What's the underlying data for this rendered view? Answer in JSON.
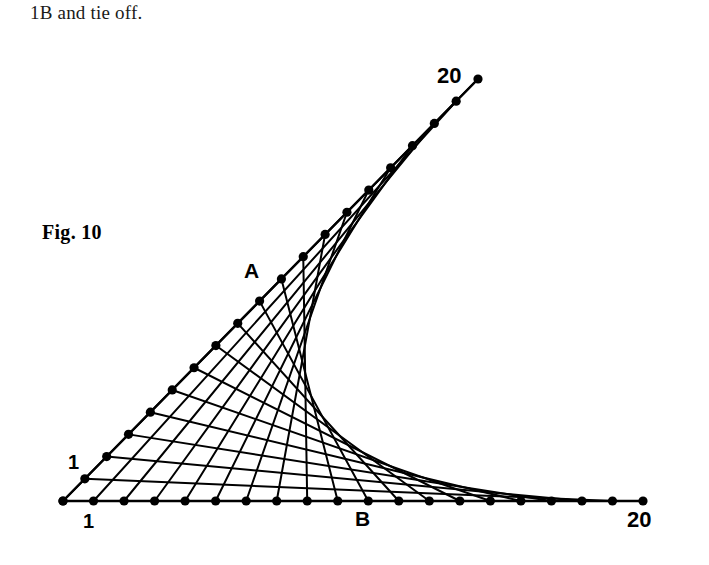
{
  "page": {
    "background_color": "#ffffff",
    "ink_color": "#000000",
    "width": 709,
    "height": 565
  },
  "body_text": {
    "line": "1B and tie off."
  },
  "figure": {
    "caption": "Fig. 10",
    "labels": {
      "ray_a": "A",
      "ray_b": "B",
      "a_start": "1",
      "b_start": "1",
      "a_end": "20",
      "b_end": "20"
    },
    "label_positions": {
      "caption": {
        "x": 42,
        "y": 222
      },
      "ray_a": {
        "x": 244,
        "y": 260
      },
      "ray_b": {
        "x": 355,
        "y": 508
      },
      "a_start": {
        "x": 68,
        "y": 452
      },
      "b_start": {
        "x": 83,
        "y": 511
      },
      "a_end": {
        "x": 437,
        "y": 65
      },
      "b_end": {
        "x": 627,
        "y": 509
      }
    }
  },
  "chart_data": {
    "type": "line",
    "title": "Fig. 10",
    "subtitle": "Curve stitching: parabolic envelope from two straight rays",
    "xlabel": "",
    "ylabel": "",
    "grid": false,
    "legend": false,
    "construction": {
      "description": "Two straight rays share a common vertex. Each ray carries 20 evenly spaced marked points numbered 1 to 20 outward from the vertex. Point i on ray A is joined by a straight thread to point (21 - i) on ray B. The 20 threads are tangent to a parabola, whose envelope forms the curve.",
      "points_per_ray": 20,
      "pairing_rule": "A[i] connects to B[21-i]",
      "vertex": {
        "x": 63,
        "y": 501
      },
      "ray_a": {
        "label": "A",
        "start_label": "1",
        "end_label": "20",
        "start": {
          "x": 63,
          "y": 501
        },
        "end": {
          "x": 478,
          "y": 79
        },
        "point_spacing_px": 29.6
      },
      "ray_b": {
        "label": "B",
        "start_label": "1",
        "end_label": "20",
        "start": {
          "x": 63,
          "y": 501
        },
        "end": {
          "x": 643,
          "y": 501
        },
        "point_spacing_px": 29.0
      },
      "thread_count": 20,
      "dot_radius_px": 4.6,
      "line_width_px": 2.0
    }
  }
}
